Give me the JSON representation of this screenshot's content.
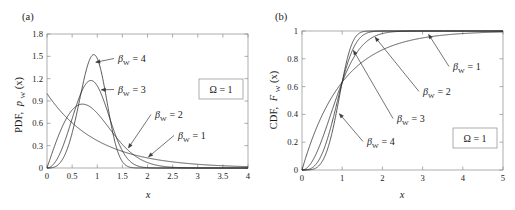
{
  "figure": {
    "background": "#ffffff",
    "curve_color": "#2b2b2b",
    "axis_color": "#8a8a8a"
  },
  "panels": [
    {
      "id": "a",
      "label": "(a)",
      "ylabel_prefix": "PDF,",
      "ylabel_symbol": "p",
      "ylabel_sub": "W",
      "ylabel_arg": "(x)",
      "xlabel": "x",
      "omega_text": "Ω = 1",
      "annotations": [
        {
          "text": "β",
          "sub": "W",
          "eq": "= 4"
        },
        {
          "text": "β",
          "sub": "W",
          "eq": "= 3"
        },
        {
          "text": "β",
          "sub": "W",
          "eq": "= 2"
        },
        {
          "text": "β",
          "sub": "W",
          "eq": "= 1"
        }
      ]
    },
    {
      "id": "b",
      "label": "(b)",
      "ylabel_prefix": "CDF,",
      "ylabel_symbol": "F",
      "ylabel_sub": "W",
      "ylabel_arg": "(x)",
      "xlabel": "x",
      "omega_text": "Ω = 1",
      "annotations": [
        {
          "text": "β",
          "sub": "W",
          "eq": "= 1"
        },
        {
          "text": "β",
          "sub": "W",
          "eq": "= 2"
        },
        {
          "text": "β",
          "sub": "W",
          "eq": "= 3"
        },
        {
          "text": "β",
          "sub": "W",
          "eq": "= 4"
        }
      ]
    }
  ],
  "chart_data": [
    {
      "type": "line",
      "panel": "a",
      "title": "(a)",
      "xlabel": "x",
      "ylabel": "PDF, p_W(x)",
      "xlim": [
        0,
        4
      ],
      "ylim": [
        0,
        1.8
      ],
      "xticks": [
        0,
        0.5,
        1,
        1.5,
        2,
        2.5,
        3,
        3.5,
        4
      ],
      "xticklabels": [
        "0",
        "0.5",
        "1",
        "1.5",
        "2",
        "2.5",
        "3",
        "3.5",
        "4"
      ],
      "yticks": [
        0,
        0.3,
        0.6,
        0.9,
        1.2,
        1.5,
        1.8
      ],
      "yticklabels": [
        "0",
        "0.3",
        "0.6",
        "0.9",
        "1.2",
        "1.5",
        "1.8"
      ],
      "grid": false,
      "legend": "annotations-inline",
      "annotation_box": "Ω = 1",
      "distribution": "weibull_pdf",
      "scale_omega": 1,
      "series": [
        {
          "name": "β_W = 1",
          "beta": 1,
          "peak_x": 0.0,
          "peak_y": 1.0
        },
        {
          "name": "β_W = 2",
          "beta": 2,
          "peak_x": 0.707,
          "peak_y": 0.858
        },
        {
          "name": "β_W = 3",
          "beta": 3,
          "peak_x": 0.874,
          "peak_y": 1.14
        },
        {
          "name": "β_W = 4",
          "beta": 4,
          "peak_x": 0.931,
          "peak_y": 1.52
        }
      ]
    },
    {
      "type": "line",
      "panel": "b",
      "title": "(b)",
      "xlabel": "x",
      "ylabel": "CDF, F_W(x)",
      "xlim": [
        0,
        5
      ],
      "ylim": [
        0,
        1
      ],
      "xticks": [
        0,
        1,
        2,
        3,
        4,
        5
      ],
      "xticklabels": [
        "0",
        "1",
        "2",
        "3",
        "4",
        "5"
      ],
      "yticks": [
        0,
        0.2,
        0.4,
        0.6,
        0.8,
        1
      ],
      "yticklabels": [
        "0",
        "0.2",
        "0.4",
        "0.6",
        "0.8",
        "1"
      ],
      "grid": false,
      "legend": "annotations-inline",
      "annotation_box": "Ω = 1",
      "distribution": "weibull_cdf",
      "scale_omega": 1,
      "common_crossing": {
        "x": 1,
        "y": 0.632
      },
      "series": [
        {
          "name": "β_W = 1",
          "beta": 1
        },
        {
          "name": "β_W = 2",
          "beta": 2
        },
        {
          "name": "β_W = 3",
          "beta": 3
        },
        {
          "name": "β_W = 4",
          "beta": 4
        }
      ]
    }
  ]
}
